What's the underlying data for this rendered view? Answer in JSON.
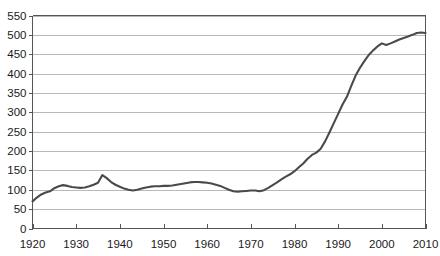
{
  "chart_data": {
    "type": "line",
    "title": "",
    "subtitle": "",
    "xlabel": "",
    "ylabel": "",
    "xlim": [
      1920,
      2010
    ],
    "ylim": [
      0,
      550
    ],
    "x_ticks": [
      1920,
      1930,
      1940,
      1950,
      1960,
      1970,
      1980,
      1990,
      2000,
      2010
    ],
    "y_ticks": [
      0,
      50,
      100,
      150,
      200,
      250,
      300,
      350,
      400,
      450,
      500,
      550
    ],
    "x_tick_labels": [
      "1920",
      "1930",
      "1940",
      "1950",
      "1960",
      "1970",
      "1980",
      "1990",
      "2000",
      "2010"
    ],
    "y_tick_labels": [
      "0",
      "50",
      "100",
      "150",
      "200",
      "250",
      "300",
      "350",
      "400",
      "450",
      "500",
      "550"
    ],
    "grid": "horizontal",
    "legend": "none",
    "legend_position": "none",
    "annotations": [],
    "series": [
      {
        "name": "series-1",
        "color": "#4a4a4a",
        "x": [
          1920,
          1921,
          1922,
          1923,
          1924,
          1925,
          1926,
          1927,
          1928,
          1929,
          1930,
          1931,
          1932,
          1933,
          1934,
          1935,
          1936,
          1937,
          1938,
          1939,
          1940,
          1941,
          1942,
          1943,
          1944,
          1945,
          1946,
          1947,
          1948,
          1949,
          1950,
          1951,
          1952,
          1953,
          1954,
          1955,
          1956,
          1957,
          1958,
          1959,
          1960,
          1961,
          1962,
          1963,
          1964,
          1965,
          1966,
          1967,
          1968,
          1969,
          1970,
          1971,
          1972,
          1973,
          1974,
          1975,
          1976,
          1977,
          1978,
          1979,
          1980,
          1981,
          1982,
          1983,
          1984,
          1985,
          1986,
          1987,
          1988,
          1989,
          1990,
          1991,
          1992,
          1993,
          1994,
          1995,
          1996,
          1997,
          1998,
          1999,
          2000,
          2001,
          2002,
          2003,
          2004,
          2005,
          2006,
          2007,
          2008,
          2009,
          2010
        ],
        "values": [
          70,
          80,
          88,
          93,
          96,
          104,
          109,
          112,
          110,
          107,
          106,
          105,
          106,
          109,
          113,
          118,
          138,
          130,
          120,
          113,
          108,
          103,
          100,
          98,
          100,
          103,
          106,
          108,
          109,
          109,
          110,
          110,
          111,
          113,
          115,
          117,
          119,
          120,
          120,
          119,
          118,
          116,
          113,
          110,
          105,
          100,
          96,
          95,
          96,
          97,
          98,
          98,
          96,
          99,
          105,
          112,
          119,
          127,
          134,
          140,
          148,
          158,
          168,
          180,
          190,
          196,
          206,
          225,
          248,
          272,
          296,
          320,
          340,
          368,
          395,
          415,
          432,
          448,
          460,
          470,
          478,
          474,
          478,
          483,
          488,
          492,
          496,
          500,
          505,
          506,
          505
        ]
      }
    ]
  },
  "axes": {
    "y_axis_name": "value-axis",
    "x_axis_name": "year-axis"
  },
  "colors": {
    "line": "#4a4a4a",
    "grid": "#9a9a9a",
    "axis": "#555555",
    "text": "#1a1a1a",
    "background": "#ffffff"
  }
}
